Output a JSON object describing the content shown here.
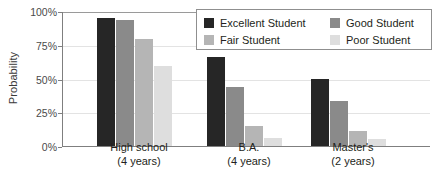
{
  "chart_data": {
    "type": "bar",
    "title": "",
    "xlabel": "",
    "ylabel": "Probability",
    "ylim": [
      0,
      100
    ],
    "yticks": [
      "0%",
      "25%",
      "50%",
      "75%",
      "100%"
    ],
    "ytick_values": [
      0,
      25,
      50,
      75,
      100
    ],
    "grid": true,
    "legend_position": "top-right",
    "categories": [
      "High school",
      "B.A.",
      "Master's"
    ],
    "category_sublabels": [
      "(4 years)",
      "(4 years)",
      "(2 years)"
    ],
    "series": [
      {
        "name": "Excellent Student",
        "color": "#262626",
        "values": [
          95,
          66,
          50
        ]
      },
      {
        "name": "Good Student",
        "color": "#8a8a8a",
        "values": [
          93,
          44,
          33
        ]
      },
      {
        "name": "Fair Student",
        "color": "#b5b5b5",
        "values": [
          79,
          15,
          11
        ]
      },
      {
        "name": "Poor Student",
        "color": "#dedede",
        "values": [
          59,
          6,
          5
        ]
      }
    ]
  },
  "legend": {
    "entries": [
      {
        "label": "Excellent Student"
      },
      {
        "label": "Good Student"
      },
      {
        "label": "Fair Student"
      },
      {
        "label": "Poor Student"
      }
    ]
  }
}
